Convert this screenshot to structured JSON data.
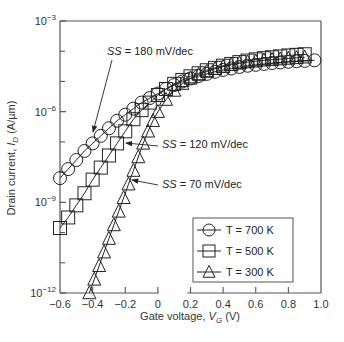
{
  "chart_data": {
    "type": "line",
    "title": "",
    "xlabel": "Gate voltage, V_G (V)",
    "xlabel_parts": {
      "prefix": "Gate voltage, ",
      "var": "V",
      "sub": "G",
      "suffix": " (V)"
    },
    "ylabel": "Drain current, I_D (A/µm)",
    "ylabel_parts": {
      "prefix": "Drain current, ",
      "var": "I",
      "sub": "D",
      "suffix": " (A/µm)"
    },
    "xlim": [
      -0.6,
      1.0
    ],
    "ylim_log10": [
      -12,
      -3
    ],
    "yscale": "log",
    "x_ticks": [
      -0.6,
      -0.4,
      -0.2,
      0,
      0.2,
      0.4,
      0.6,
      0.8,
      1.0
    ],
    "x_tick_labels": [
      "−0.6",
      "−0.4",
      "−0.2",
      "0",
      "0.2",
      "0.4",
      "0.6",
      "0.8",
      "1.0"
    ],
    "y_ticks_log10": [
      -3,
      -6,
      -9,
      -12
    ],
    "y_minor_ticks_log10": [
      -4,
      -5,
      -7,
      -8,
      -10,
      -11
    ],
    "y_tick_labels": [
      {
        "base": "10",
        "exp": "−3"
      },
      {
        "base": "10",
        "exp": "−6"
      },
      {
        "base": "10",
        "exp": "−9"
      },
      {
        "base": "10",
        "exp": "−12"
      }
    ],
    "grid": false,
    "legend_position": "lower right",
    "series": [
      {
        "name": "T = 700 K",
        "marker": "circle",
        "x": [
          -0.6,
          -0.55,
          -0.5,
          -0.45,
          -0.4,
          -0.35,
          -0.3,
          -0.25,
          -0.2,
          -0.15,
          -0.1,
          -0.05,
          0.0,
          0.05,
          0.1,
          0.15,
          0.2,
          0.25,
          0.3,
          0.35,
          0.4,
          0.45,
          0.5,
          0.55,
          0.6,
          0.65,
          0.7,
          0.75,
          0.8,
          0.85,
          0.9,
          0.96
        ],
        "log10_y": [
          -8.2,
          -7.9,
          -7.6,
          -7.3,
          -7.05,
          -6.8,
          -6.55,
          -6.3,
          -6.1,
          -5.9,
          -5.7,
          -5.55,
          -5.4,
          -5.25,
          -5.12,
          -5.0,
          -4.9,
          -4.82,
          -4.75,
          -4.68,
          -4.62,
          -4.57,
          -4.52,
          -4.48,
          -4.45,
          -4.42,
          -4.39,
          -4.37,
          -4.35,
          -4.33,
          -4.32,
          -4.3
        ]
      },
      {
        "name": "T = 500 K",
        "marker": "square",
        "x": [
          -0.6,
          -0.55,
          -0.5,
          -0.45,
          -0.4,
          -0.35,
          -0.3,
          -0.25,
          -0.2,
          -0.15,
          -0.1,
          -0.05,
          0.0,
          0.05,
          0.1,
          0.15,
          0.2,
          0.25,
          0.3,
          0.35,
          0.4,
          0.45,
          0.5,
          0.55,
          0.6,
          0.65,
          0.7,
          0.75,
          0.8,
          0.85,
          0.9
        ],
        "log10_y": [
          -9.85,
          -9.5,
          -9.1,
          -8.7,
          -8.25,
          -7.85,
          -7.45,
          -7.05,
          -6.65,
          -6.25,
          -5.95,
          -5.7,
          -5.45,
          -5.25,
          -5.08,
          -4.95,
          -4.83,
          -4.73,
          -4.63,
          -4.55,
          -4.48,
          -4.42,
          -4.36,
          -4.31,
          -4.27,
          -4.23,
          -4.2,
          -4.17,
          -4.14,
          -4.12,
          -4.1
        ]
      },
      {
        "name": "T = 300 K",
        "marker": "triangle",
        "x": [
          -0.42,
          -0.39,
          -0.36,
          -0.33,
          -0.3,
          -0.27,
          -0.24,
          -0.21,
          -0.18,
          -0.15,
          -0.12,
          -0.09,
          -0.06,
          -0.03,
          0.0,
          0.05,
          0.1,
          0.15,
          0.2,
          0.25,
          0.3,
          0.35,
          0.4,
          0.45,
          0.5,
          0.55,
          0.6,
          0.65,
          0.7,
          0.75,
          0.8,
          0.85,
          0.9
        ],
        "log10_y": [
          -12.0,
          -11.55,
          -11.1,
          -10.65,
          -10.2,
          -9.75,
          -9.3,
          -8.85,
          -8.4,
          -7.95,
          -7.5,
          -7.05,
          -6.65,
          -6.3,
          -6.0,
          -5.6,
          -5.3,
          -5.07,
          -4.9,
          -4.77,
          -4.67,
          -4.58,
          -4.51,
          -4.45,
          -4.4,
          -4.36,
          -4.33,
          -4.3,
          -4.28,
          -4.26,
          -4.24,
          -4.22,
          -4.2
        ]
      }
    ],
    "annotations": [
      {
        "prefix": "SS",
        "text": " = 180 mV/dec",
        "target_series": "T = 700 K"
      },
      {
        "prefix": "SS",
        "text": " = 120 mV/dec",
        "target_series": "T = 500 K"
      },
      {
        "prefix": "SS",
        "text": " = 70 mV/dec",
        "target_series": "T = 300 K"
      }
    ]
  },
  "legend": {
    "items": [
      {
        "label": "T = 700 K",
        "marker": "circle"
      },
      {
        "label": "T = 500 K",
        "marker": "square"
      },
      {
        "label": "T = 300 K",
        "marker": "triangle"
      }
    ]
  },
  "colors": {
    "line": "#222222",
    "axis": "#555555",
    "background": "#ffffff"
  }
}
